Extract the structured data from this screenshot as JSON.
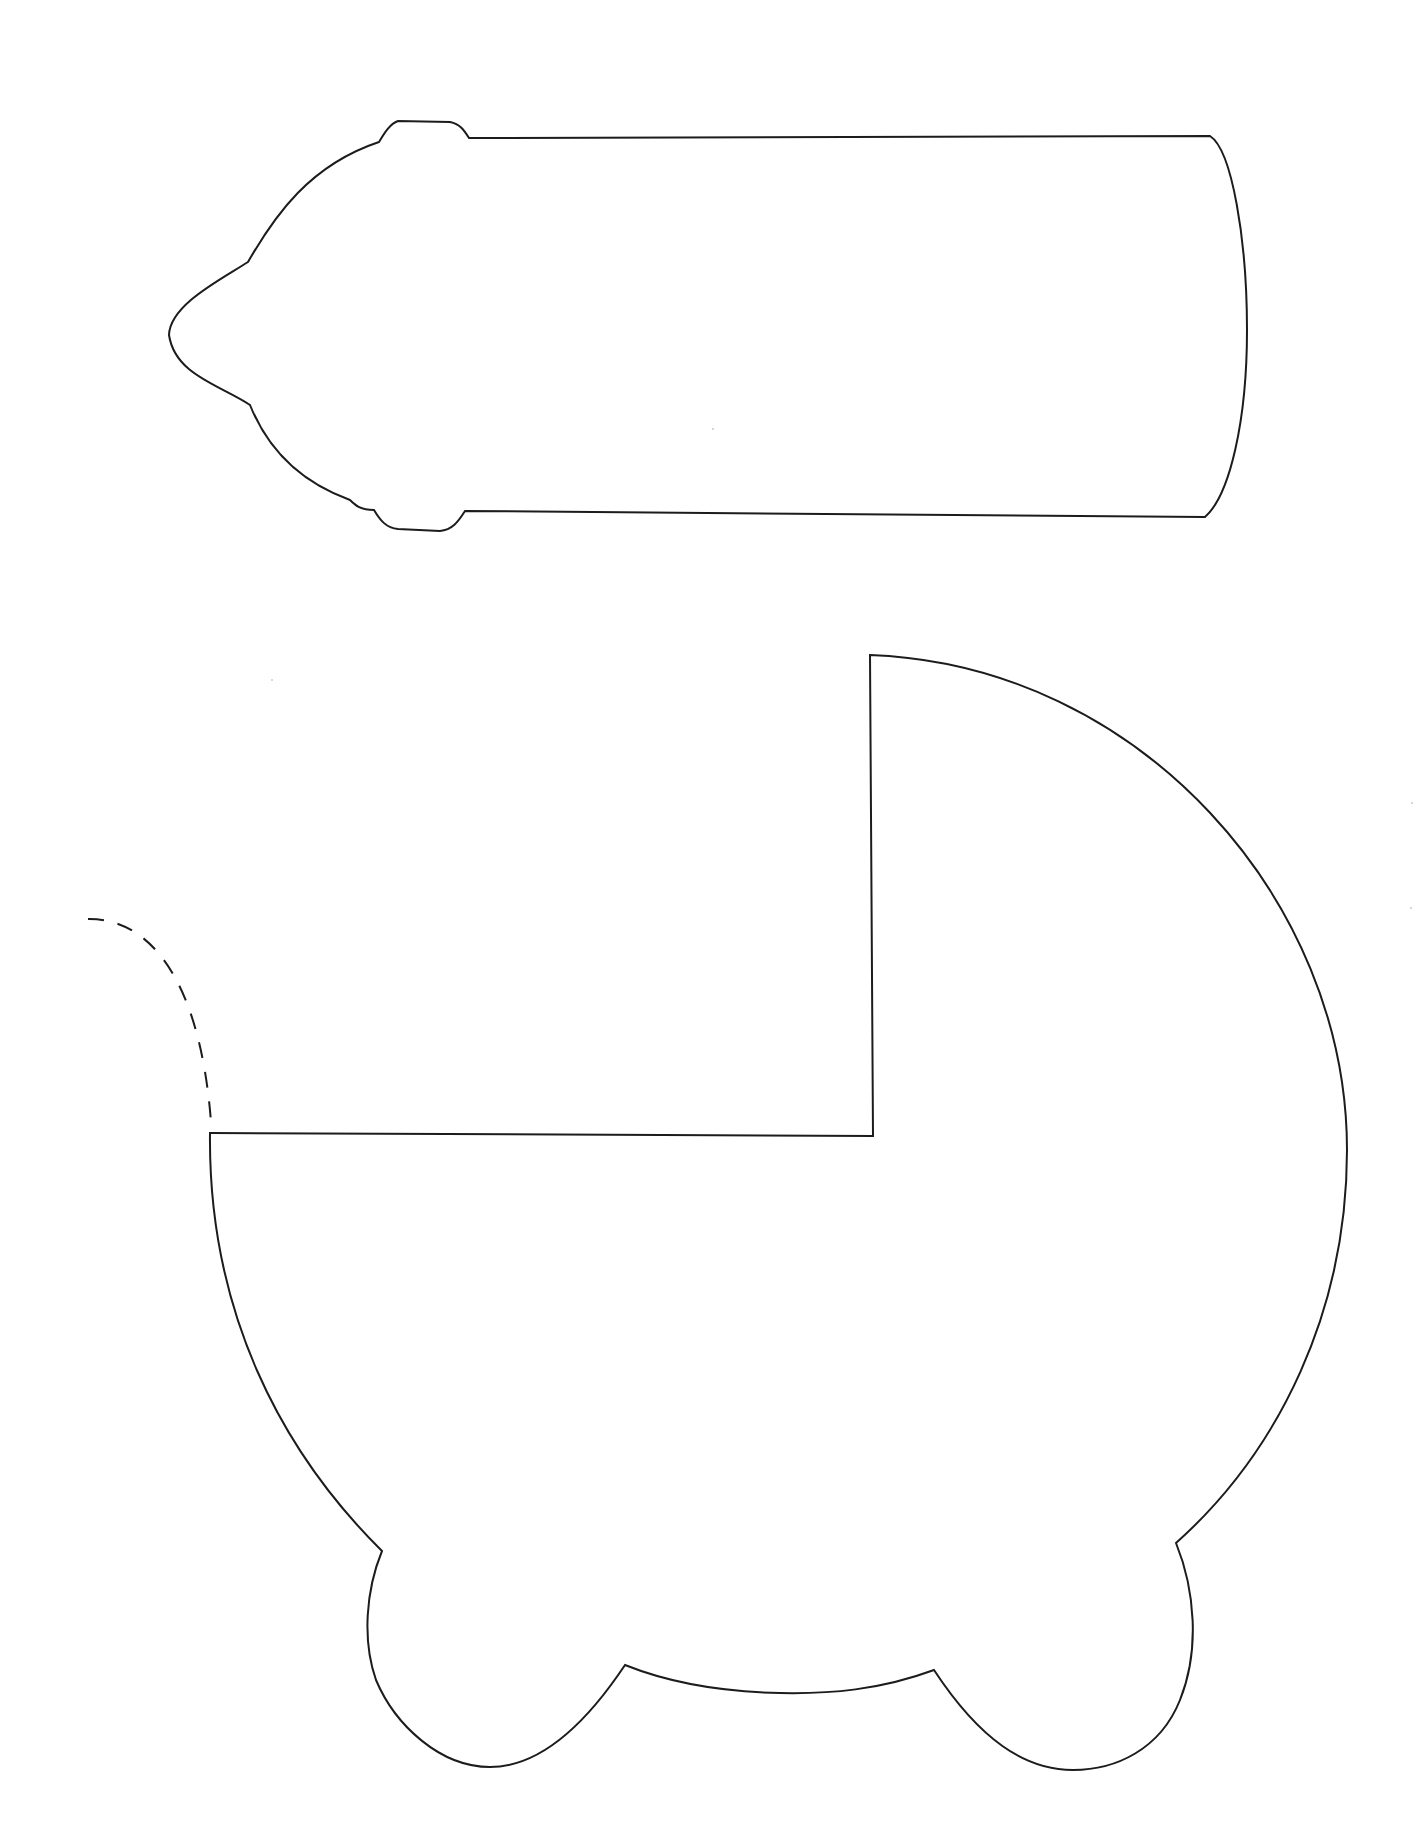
{
  "page": {
    "title": "Baby bottle and baby carriage cut-out template",
    "background_color": "#ffffff",
    "stroke_color": "#1c1c1c"
  },
  "shapes": [
    {
      "id": "baby-bottle",
      "label": "Baby bottle outline",
      "type": "solid-outline"
    },
    {
      "id": "baby-carriage",
      "label": "Baby carriage (pram) outline",
      "type": "solid-outline"
    },
    {
      "id": "carriage-handle",
      "label": "Carriage handle guide",
      "type": "dashed-line"
    }
  ]
}
